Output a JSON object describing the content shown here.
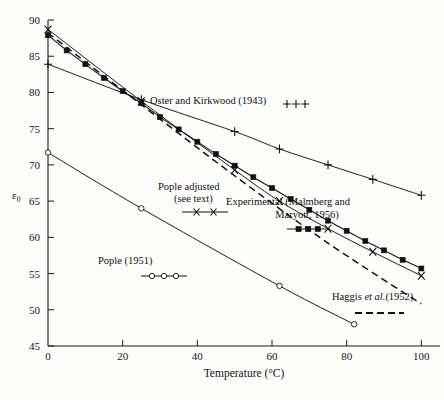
{
  "chart_data": {
    "type": "line",
    "title": "",
    "xlabel": "Temperature (°C)",
    "ylabel": "ε",
    "ylabel_sub": "0",
    "xlim": [
      0,
      105
    ],
    "ylim": [
      45,
      90
    ],
    "xticks": [
      0,
      20,
      40,
      60,
      80,
      100
    ],
    "xticklabels": [
      "0",
      "20",
      "40",
      "60",
      "80",
      "100"
    ],
    "yticks": [
      45,
      50,
      55,
      60,
      65,
      70,
      75,
      80,
      85,
      90
    ],
    "yticklabels": [
      "45",
      "50",
      "55",
      "60",
      "65",
      "70",
      "75",
      "80",
      "85",
      "90"
    ],
    "grid": false,
    "legend_position": "inline-annotations",
    "series": [
      {
        "name": "Experimental (Malmberg and Maryott, 1956)",
        "label_line1": "Experimental (Malmberg and",
        "label_line2": "Maryott, 1956)",
        "marker": "filled-square",
        "linestyle": "solid",
        "x": [
          0,
          5,
          10,
          15,
          20,
          25,
          30,
          35,
          40,
          45,
          50,
          55,
          60,
          65,
          70,
          75,
          80,
          85,
          90,
          95,
          100
        ],
        "y": [
          87.9,
          85.8,
          83.9,
          82.0,
          80.2,
          78.5,
          76.6,
          74.9,
          73.2,
          71.5,
          69.9,
          68.3,
          66.8,
          65.3,
          63.8,
          62.3,
          60.9,
          59.5,
          58.2,
          56.9,
          55.7
        ]
      },
      {
        "name": "Pople adjusted (see text)",
        "label_line1": "Pople adjusted",
        "label_line2": "(see text)",
        "marker": "cross",
        "linestyle": "solid",
        "x": [
          0,
          25,
          50,
          62,
          75,
          87,
          100
        ],
        "y": [
          88.7,
          78.8,
          69.3,
          65.0,
          61.2,
          58.0,
          54.7
        ]
      },
      {
        "name": "Oster and Kirkwood (1943)",
        "label_line1": "Oster and Kirkwood (1943)",
        "marker": "plus",
        "linestyle": "solid",
        "x": [
          0,
          25,
          50,
          62,
          75,
          87,
          100
        ],
        "y": [
          83.9,
          79.0,
          74.6,
          72.2,
          70.0,
          68.0,
          65.8
        ]
      },
      {
        "name": "Haggis et al. (1952)",
        "label_pre": "Haggis ",
        "label_ital": "et al.",
        "label_post": "(1952)",
        "marker": "none",
        "linestyle": "dashed",
        "x": [
          0,
          25,
          50,
          75,
          100
        ],
        "y": [
          88.2,
          78.3,
          68.5,
          59.2,
          50.8
        ]
      },
      {
        "name": "Pople (1951)",
        "label_line1": "Pople (1951)",
        "marker": "open-circle",
        "linestyle": "solid",
        "x": [
          0,
          25,
          62,
          82
        ],
        "y": [
          71.7,
          64.0,
          53.3,
          48.0
        ]
      }
    ],
    "annotations": [
      {
        "id": "oster-kirkwood",
        "text": "Oster and Kirkwood (1943)",
        "key": "plus"
      },
      {
        "id": "pople-adjusted",
        "text": "Pople adjusted (see text)",
        "key": "cross"
      },
      {
        "id": "experimental",
        "text": "Experimental (Malmberg and Maryott, 1956)",
        "key": "filled-square"
      },
      {
        "id": "haggis",
        "text": "Haggis et al.(1952)",
        "key": "dashed"
      },
      {
        "id": "pople-1951",
        "text": "Pople (1951)",
        "key": "open-circle"
      }
    ],
    "colors": {
      "ink": "#121212",
      "background": "#fdfdfb"
    }
  }
}
